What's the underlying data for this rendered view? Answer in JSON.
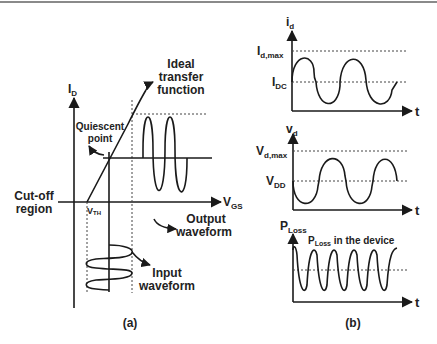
{
  "figure_a": {
    "caption": "(a)",
    "y_axis_label_main": "I",
    "y_axis_label_sub": "D",
    "x_axis_label_main": "V",
    "x_axis_label_sub": "GS",
    "vth_label_main": "V",
    "vth_label_sub": "TH",
    "annotations": {
      "ideal_transfer_1": "Ideal",
      "ideal_transfer_2": "transfer",
      "ideal_transfer_3": "function",
      "quiescent_1": "Quiescent",
      "quiescent_2": "point",
      "cutoff_1": "Cut-off",
      "cutoff_2": "region",
      "output_1": "Output",
      "output_2": "waveform",
      "input_1": "Input",
      "input_2": "waveform"
    }
  },
  "figure_b": {
    "caption": "(b)",
    "id_plot": {
      "y_label_main": "i",
      "y_label_sub": "d",
      "level_max_main": "I",
      "level_max_sub": "d,max",
      "level_dc_main": "I",
      "level_dc_sub": "DC",
      "x_label": "t"
    },
    "vd_plot": {
      "y_label_main": "v",
      "y_label_sub": "d",
      "level_max_main": "V",
      "level_max_sub": "d,max",
      "level_dc_main": "V",
      "level_dc_sub": "DD",
      "x_label": "t"
    },
    "ploss_plot": {
      "y_label_main": "P",
      "y_label_sub": "Loss",
      "annotation_main": "P",
      "annotation_sub": "Loss",
      "annotation_rest": " in the device",
      "x_label": "t"
    }
  },
  "colors": {
    "line": "#1a1a1a",
    "dotted": "#444444",
    "background": "#ffffff"
  }
}
